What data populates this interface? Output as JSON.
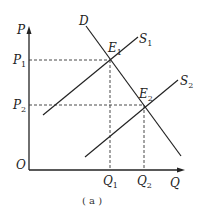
{
  "diagram": {
    "caption": "( a )",
    "axes": {
      "y_label": "P",
      "x_label": "Q",
      "origin_label": "O"
    },
    "curves": [
      {
        "name": "D",
        "label": "D",
        "sub": ""
      },
      {
        "name": "S1",
        "label": "S",
        "sub": "1"
      },
      {
        "name": "S2",
        "label": "S",
        "sub": "2"
      }
    ],
    "equilibria": [
      {
        "label": "E",
        "sub": "1"
      },
      {
        "label": "E",
        "sub": "2"
      }
    ],
    "price_ticks": [
      {
        "label": "P",
        "sub": "1"
      },
      {
        "label": "P",
        "sub": "2"
      }
    ],
    "quantity_ticks": [
      {
        "label": "Q",
        "sub": "1"
      },
      {
        "label": "Q",
        "sub": "2"
      }
    ],
    "colors": {
      "line": "#222222",
      "background": "#ffffff"
    }
  }
}
